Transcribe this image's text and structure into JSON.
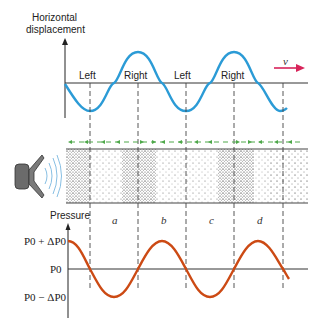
{
  "diagram": {
    "top_graph": {
      "y_axis_label_line1": "Horizontal",
      "y_axis_label_line2": "displacement",
      "markers": [
        "Left",
        "Right",
        "Left",
        "Right"
      ],
      "velocity_label": "v",
      "curve_color": "#2b9bd6",
      "arrow_color": "#d8245a"
    },
    "tube": {
      "region_labels": [
        "a",
        "b",
        "c",
        "d"
      ],
      "arrow_color": "#4ea84a"
    },
    "bottom_graph": {
      "y_axis_label": "Pressure",
      "level_high": "P0 + ΔP0",
      "level_mid": "P0",
      "level_low": "P0 − ΔP0",
      "curve_color": "#cc4a14"
    }
  }
}
